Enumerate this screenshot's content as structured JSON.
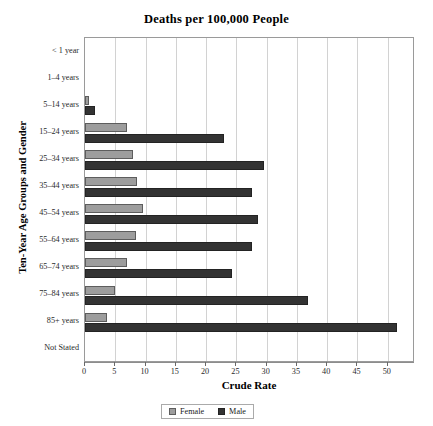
{
  "chart_data": {
    "type": "bar",
    "orientation": "horizontal",
    "title": "Deaths per 100,000 People",
    "xlabel": "Crude Rate",
    "ylabel": "Ten-Year Age Groups and Gender",
    "categories": [
      "< 1 year",
      "1–4 years",
      "5–14 years",
      "15–24 years",
      "25–34 years",
      "35–44 years",
      "45–54 years",
      "55–64 years",
      "65–74 years",
      "75–84 years",
      "85+ years",
      "Not Stated"
    ],
    "series": [
      {
        "name": "Female",
        "color": "#9d9d9d",
        "values": [
          0,
          0,
          0.6,
          7.0,
          8.0,
          8.6,
          9.5,
          8.5,
          7.0,
          5.0,
          3.7,
          0
        ]
      },
      {
        "name": "Male",
        "color": "#333333",
        "values": [
          0,
          0,
          1.6,
          23.0,
          29.5,
          27.5,
          28.5,
          27.5,
          24.3,
          36.8,
          51.6,
          0
        ]
      }
    ],
    "xlim": [
      0,
      54.5
    ],
    "xticks": [
      0,
      5,
      10,
      15,
      20,
      25,
      30,
      35,
      40,
      45,
      50
    ],
    "xtick_labels": [
      "0",
      "5",
      "10",
      "15",
      "20",
      "25",
      "30",
      "35",
      "40",
      "45",
      "50"
    ],
    "grid": "vertical",
    "legend_position": "bottom-center",
    "legend_entries": [
      "Female",
      "Male"
    ]
  }
}
